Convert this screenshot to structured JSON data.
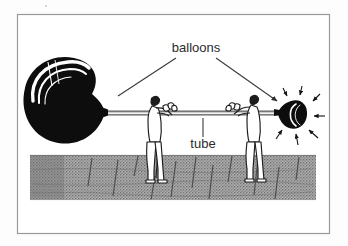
{
  "figure": {
    "kind": "illustration-diagram",
    "title_text": "",
    "background_color": "#fdfdfd",
    "frame": {
      "name": "figure-border",
      "color": "#9a9a9a",
      "x": 17,
      "y": 14,
      "width": 313,
      "height": 220,
      "stroke_width": 1.2
    },
    "labels": [
      {
        "id": "balloons",
        "text": "balloons",
        "x": 196,
        "y": 52,
        "anchor": "middle",
        "font_size": 13,
        "color": "#2b2b2b"
      },
      {
        "id": "tube",
        "text": "tube",
        "x": 203,
        "y": 148,
        "anchor": "middle",
        "font_size": 13,
        "color": "#2b2b2b"
      }
    ],
    "leader_lines": [
      {
        "id": "balloons-to-left-balloon",
        "from_x": 176,
        "from_y": 58,
        "to_x": 118,
        "to_y": 96,
        "arrowhead": false,
        "color": "#3a3a3a"
      },
      {
        "id": "balloons-to-right-balloon",
        "from_x": 216,
        "from_y": 58,
        "to_x": 279,
        "to_y": 102,
        "arrowhead": true,
        "color": "#3a3a3a"
      },
      {
        "id": "tube-to-tube",
        "from_x": 203,
        "from_y": 137,
        "to_x": 203,
        "to_y": 118,
        "arrowhead": false,
        "color": "#3a3a3a"
      }
    ],
    "objects": {
      "left_balloon": {
        "name": "inflated-balloon",
        "state": "inflated",
        "fill_color": "#0d0d0d",
        "highlight_color": "#ffffff",
        "center_x": 64,
        "center_y": 98,
        "radius_x": 40,
        "radius_y": 38
      },
      "right_balloon": {
        "name": "deflated-balloon",
        "state": "deflating",
        "fill_color": "#0d0d0d",
        "highlight_color": "#ffffff",
        "center_x": 290,
        "center_y": 115,
        "radius_x": 14,
        "radius_y": 14,
        "motion_arrow_count": 7
      },
      "tube": {
        "name": "connecting-tube",
        "color": "#1c1c1c",
        "x1": 104,
        "x2": 278,
        "y": 113,
        "thickness": 4
      },
      "figures": [
        {
          "name": "person-left",
          "x": 155,
          "y": 112,
          "height": 62,
          "color": "#1c1c1c"
        },
        {
          "name": "person-right",
          "x": 251,
          "y": 112,
          "height": 62,
          "color": "#1c1c1c"
        }
      ],
      "ground": {
        "name": "wooden-floor",
        "x": 30,
        "y": 155,
        "width": 286,
        "height": 45,
        "base_color": "#9b9b9b",
        "texture": "halftone-plank",
        "plank_line_color": "#4a4a4a"
      }
    }
  }
}
